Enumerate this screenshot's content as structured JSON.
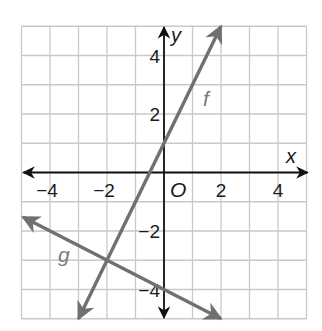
{
  "chart_data": {
    "type": "line",
    "title": "",
    "xlabel": "x",
    "ylabel": "y",
    "origin_label": "O",
    "xlim": [
      -5,
      5
    ],
    "ylim": [
      -5,
      5
    ],
    "grid": true,
    "grid_step": 1,
    "x_ticks": [
      {
        "value": -4,
        "label": "−4"
      },
      {
        "value": -2,
        "label": "−2"
      },
      {
        "value": 2,
        "label": "2"
      },
      {
        "value": 4,
        "label": "4"
      }
    ],
    "y_ticks": [
      {
        "value": 4,
        "label": "4"
      },
      {
        "value": 2,
        "label": "2"
      },
      {
        "value": -2,
        "label": "−2"
      },
      {
        "value": -4,
        "label": "−4"
      }
    ],
    "series": [
      {
        "name": "f",
        "equation": "y = 2x + 1",
        "slope": 2,
        "intercept": 1,
        "x": [
          -3,
          2
        ],
        "y": [
          -5,
          5
        ],
        "color": "#707070"
      },
      {
        "name": "g",
        "equation": "y = -0.5x - 4",
        "slope": -0.5,
        "intercept": -4,
        "x": [
          -4.95,
          2
        ],
        "y": [
          -1.525,
          -5
        ],
        "color": "#707070"
      }
    ],
    "intersection": {
      "x": -2,
      "y": -3
    },
    "legend": "inline labels f and g"
  },
  "colors": {
    "grid": "#c9c9c9",
    "axis": "#111111",
    "lines": "#707070",
    "labels": "#7a7a7a"
  }
}
